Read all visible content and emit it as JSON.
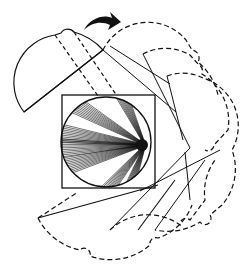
{
  "diagram": {
    "colors": {
      "stroke": "#111111",
      "background": "#ffffff"
    },
    "components": {
      "object_field": "square-with-circle",
      "ray_bundles": 7,
      "scanner_positions": {
        "solid": 1,
        "dashed": 4
      },
      "rotation_arrow": "clockwise-arrow-icon"
    }
  }
}
